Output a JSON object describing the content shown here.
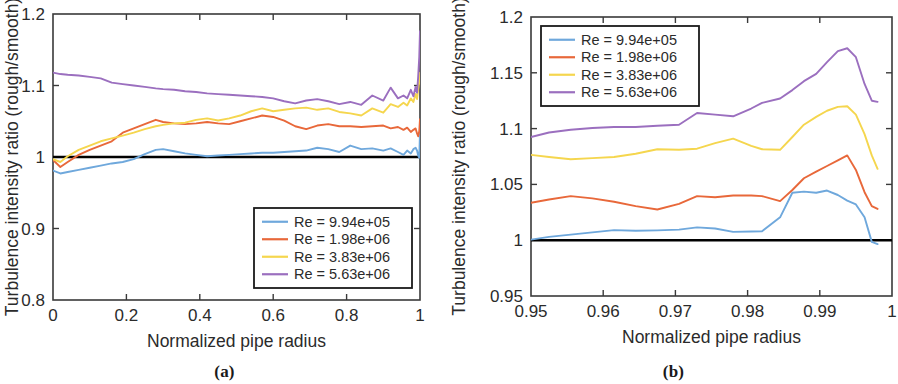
{
  "figure": {
    "panels": [
      {
        "id": "a",
        "caption": "(a)"
      },
      {
        "id": "b",
        "caption": "(b)"
      }
    ]
  },
  "colors": {
    "series_1": "#6FA8DC",
    "series_2": "#E8683A",
    "series_3": "#F5D64E",
    "series_4": "#9B6FBF",
    "reference_line": "#000000",
    "axis": "#3a3a3a",
    "text": "#2b2b2b"
  },
  "chart_data": [
    {
      "type": "line",
      "panel": "a",
      "title": "",
      "xlabel": "Normalized pipe radius",
      "ylabel": "Turbulence intensity ratio (rough/smooth)",
      "xlim": [
        0,
        1
      ],
      "ylim": [
        0.8,
        1.2
      ],
      "xticks": [
        0,
        0.2,
        0.4,
        0.6,
        0.8,
        1
      ],
      "xtick_labels": [
        "0",
        "0.2",
        "0.4",
        "0.6",
        "0.8",
        "1"
      ],
      "yticks": [
        0.8,
        0.9,
        1.0,
        1.1,
        1.2
      ],
      "ytick_labels": [
        "0.8",
        "0.9",
        "1",
        "1.1",
        "1.2"
      ],
      "grid": false,
      "legend_position": "lower right",
      "reference_line_y": 1.0,
      "series": [
        {
          "name": "Re = 9.94e+05",
          "color": "#6FA8DC",
          "x": [
            0.0,
            0.02,
            0.04,
            0.07,
            0.1,
            0.13,
            0.16,
            0.19,
            0.22,
            0.25,
            0.28,
            0.3,
            0.33,
            0.36,
            0.39,
            0.42,
            0.45,
            0.48,
            0.51,
            0.54,
            0.57,
            0.6,
            0.63,
            0.66,
            0.69,
            0.72,
            0.75,
            0.78,
            0.81,
            0.84,
            0.87,
            0.9,
            0.92,
            0.94,
            0.955,
            0.965,
            0.975,
            0.982,
            0.988,
            0.992,
            0.995,
            0.998,
            1.0
          ],
          "y": [
            0.981,
            0.977,
            0.979,
            0.982,
            0.985,
            0.988,
            0.991,
            0.993,
            0.997,
            1.004,
            1.01,
            1.011,
            1.008,
            1.005,
            1.003,
            1.001,
            1.002,
            1.003,
            1.004,
            1.005,
            1.006,
            1.006,
            1.007,
            1.008,
            1.009,
            1.013,
            1.011,
            1.007,
            1.016,
            1.011,
            1.012,
            1.009,
            1.012,
            1.007,
            1.003,
            1.009,
            1.005,
            1.011,
            1.013,
            1.009,
            1.002,
            0.999,
            1.035
          ]
        },
        {
          "name": "Re = 1.98e+06",
          "color": "#E8683A",
          "x": [
            0.0,
            0.02,
            0.04,
            0.07,
            0.1,
            0.13,
            0.16,
            0.19,
            0.22,
            0.25,
            0.28,
            0.3,
            0.33,
            0.36,
            0.39,
            0.42,
            0.45,
            0.48,
            0.51,
            0.54,
            0.57,
            0.6,
            0.63,
            0.66,
            0.69,
            0.72,
            0.75,
            0.78,
            0.81,
            0.84,
            0.87,
            0.9,
            0.92,
            0.94,
            0.955,
            0.965,
            0.975,
            0.982,
            0.988,
            0.992,
            0.995,
            0.998,
            1.0
          ],
          "y": [
            0.996,
            0.986,
            0.993,
            1.003,
            1.01,
            1.016,
            1.022,
            1.034,
            1.04,
            1.046,
            1.052,
            1.049,
            1.047,
            1.046,
            1.047,
            1.049,
            1.047,
            1.046,
            1.05,
            1.054,
            1.058,
            1.056,
            1.051,
            1.043,
            1.039,
            1.044,
            1.046,
            1.043,
            1.043,
            1.042,
            1.043,
            1.044,
            1.04,
            1.042,
            1.038,
            1.041,
            1.035,
            1.038,
            1.04,
            1.033,
            1.029,
            1.036,
            1.053
          ]
        },
        {
          "name": "Re = 3.83e+06",
          "color": "#F5D64E",
          "x": [
            0.0,
            0.02,
            0.04,
            0.07,
            0.1,
            0.13,
            0.16,
            0.19,
            0.22,
            0.25,
            0.28,
            0.3,
            0.33,
            0.36,
            0.39,
            0.42,
            0.45,
            0.48,
            0.51,
            0.54,
            0.57,
            0.6,
            0.63,
            0.66,
            0.69,
            0.72,
            0.75,
            0.78,
            0.81,
            0.84,
            0.87,
            0.9,
            0.92,
            0.94,
            0.955,
            0.965,
            0.975,
            0.982,
            0.988,
            0.992,
            0.995,
            0.998,
            1.0
          ],
          "y": [
            0.997,
            0.993,
            1.001,
            1.01,
            1.016,
            1.022,
            1.026,
            1.03,
            1.034,
            1.039,
            1.043,
            1.045,
            1.047,
            1.048,
            1.052,
            1.054,
            1.051,
            1.054,
            1.058,
            1.064,
            1.068,
            1.064,
            1.066,
            1.068,
            1.069,
            1.066,
            1.068,
            1.063,
            1.061,
            1.058,
            1.068,
            1.062,
            1.074,
            1.07,
            1.076,
            1.072,
            1.082,
            1.077,
            1.088,
            1.081,
            1.095,
            1.105,
            1.118
          ]
        },
        {
          "name": "Re = 5.63e+06",
          "color": "#9B6FBF",
          "x": [
            0.0,
            0.02,
            0.04,
            0.07,
            0.1,
            0.13,
            0.16,
            0.19,
            0.22,
            0.25,
            0.28,
            0.3,
            0.33,
            0.36,
            0.39,
            0.42,
            0.45,
            0.48,
            0.51,
            0.54,
            0.57,
            0.6,
            0.63,
            0.66,
            0.69,
            0.72,
            0.75,
            0.78,
            0.81,
            0.84,
            0.87,
            0.9,
            0.92,
            0.94,
            0.955,
            0.965,
            0.975,
            0.982,
            0.988,
            0.992,
            0.995,
            0.998,
            1.0
          ],
          "y": [
            1.118,
            1.116,
            1.115,
            1.114,
            1.112,
            1.11,
            1.104,
            1.102,
            1.1,
            1.098,
            1.096,
            1.095,
            1.094,
            1.092,
            1.091,
            1.089,
            1.088,
            1.087,
            1.086,
            1.085,
            1.084,
            1.082,
            1.078,
            1.075,
            1.079,
            1.081,
            1.078,
            1.074,
            1.077,
            1.073,
            1.086,
            1.079,
            1.097,
            1.082,
            1.086,
            1.082,
            1.094,
            1.085,
            1.098,
            1.09,
            1.112,
            1.14,
            1.176
          ]
        }
      ],
      "legend": [
        {
          "label": "Re = 9.94e+05",
          "color": "#6FA8DC"
        },
        {
          "label": "Re = 1.98e+06",
          "color": "#E8683A"
        },
        {
          "label": "Re = 3.83e+06",
          "color": "#F5D64E"
        },
        {
          "label": "Re = 5.63e+06",
          "color": "#9B6FBF"
        }
      ]
    },
    {
      "type": "line",
      "panel": "b",
      "title": "",
      "xlabel": "Normalized pipe radius",
      "ylabel": "Turbulence intensity ratio (rough/smooth)",
      "xlim": [
        0.95,
        1.0
      ],
      "ylim": [
        0.95,
        1.2
      ],
      "xticks": [
        0.95,
        0.96,
        0.97,
        0.98,
        0.99,
        1.0
      ],
      "xtick_labels": [
        "0.95",
        "0.96",
        "0.97",
        "0.98",
        "0.99",
        "1"
      ],
      "yticks": [
        0.95,
        1.0,
        1.05,
        1.1,
        1.15,
        1.2
      ],
      "ytick_labels": [
        "0.95",
        "1",
        "1.05",
        "1.1",
        "1.15",
        "1.2"
      ],
      "grid": false,
      "legend_position": "upper left",
      "reference_line_y": 1.0,
      "series": [
        {
          "name": "Re = 9.94e+05",
          "color": "#6FA8DC",
          "x": [
            0.95,
            0.9525,
            0.9555,
            0.9585,
            0.9615,
            0.9645,
            0.9675,
            0.9705,
            0.973,
            0.9755,
            0.978,
            0.9805,
            0.982,
            0.9845,
            0.9862,
            0.9878,
            0.9895,
            0.991,
            0.9925,
            0.9938,
            0.995,
            0.9962,
            0.9972,
            0.998
          ],
          "y": [
            1.0005,
            1.003,
            1.005,
            1.007,
            1.009,
            1.0085,
            1.0088,
            1.0095,
            1.0115,
            1.0105,
            1.0075,
            1.0078,
            1.008,
            1.0205,
            1.0425,
            1.0435,
            1.0425,
            1.0445,
            1.0405,
            1.0355,
            1.032,
            1.0205,
            0.9985,
            0.9965
          ]
        },
        {
          "name": "Re = 1.98e+06",
          "color": "#E8683A",
          "x": [
            0.95,
            0.9525,
            0.9555,
            0.9585,
            0.9615,
            0.9645,
            0.9675,
            0.9705,
            0.973,
            0.9755,
            0.978,
            0.9805,
            0.982,
            0.9845,
            0.9862,
            0.9878,
            0.9895,
            0.991,
            0.9925,
            0.9938,
            0.995,
            0.9962,
            0.9972,
            0.998
          ],
          "y": [
            1.0335,
            1.0365,
            1.0395,
            1.0375,
            1.0345,
            1.0305,
            1.0275,
            1.0325,
            1.0395,
            1.0385,
            1.04,
            1.04,
            1.0395,
            1.035,
            1.045,
            1.0555,
            1.0615,
            1.0665,
            1.0715,
            1.076,
            1.063,
            1.043,
            1.0305,
            1.028
          ]
        },
        {
          "name": "Re = 3.83e+06",
          "color": "#F5D64E",
          "x": [
            0.95,
            0.9525,
            0.9555,
            0.9585,
            0.9615,
            0.9645,
            0.9675,
            0.9705,
            0.973,
            0.9755,
            0.978,
            0.9805,
            0.982,
            0.9845,
            0.9862,
            0.9878,
            0.9895,
            0.991,
            0.9925,
            0.9938,
            0.995,
            0.9962,
            0.9972,
            0.998
          ],
          "y": [
            1.0765,
            1.0745,
            1.0725,
            1.0735,
            1.0745,
            1.0775,
            1.0815,
            1.081,
            1.082,
            1.087,
            1.091,
            1.0845,
            1.0815,
            1.081,
            1.0925,
            1.1035,
            1.1105,
            1.116,
            1.1195,
            1.12,
            1.1125,
            1.095,
            1.076,
            1.064
          ]
        },
        {
          "name": "Re = 5.63e+06",
          "color": "#9B6FBF",
          "x": [
            0.95,
            0.9525,
            0.9555,
            0.9585,
            0.9615,
            0.9645,
            0.9675,
            0.9705,
            0.973,
            0.9755,
            0.978,
            0.9805,
            0.982,
            0.9845,
            0.9862,
            0.9878,
            0.9895,
            0.991,
            0.9925,
            0.9938,
            0.995,
            0.9962,
            0.9972,
            0.998
          ],
          "y": [
            1.0925,
            1.0965,
            1.099,
            1.1005,
            1.1015,
            1.1015,
            1.1025,
            1.1035,
            1.114,
            1.1125,
            1.111,
            1.118,
            1.123,
            1.127,
            1.1345,
            1.1425,
            1.149,
            1.1595,
            1.1695,
            1.172,
            1.164,
            1.14,
            1.125,
            1.124
          ]
        }
      ],
      "legend": [
        {
          "label": "Re = 9.94e+05",
          "color": "#6FA8DC"
        },
        {
          "label": "Re = 1.98e+06",
          "color": "#E8683A"
        },
        {
          "label": "Re = 3.83e+06",
          "color": "#F5D64E"
        },
        {
          "label": "Re = 5.63e+06",
          "color": "#9B6FBF"
        }
      ]
    }
  ]
}
